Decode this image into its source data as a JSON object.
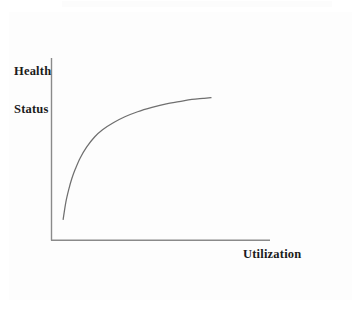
{
  "figure": {
    "background_color": "#fdfdfd",
    "frame_color": "#3a3a3a",
    "axis_color": "#8a8a8a",
    "curve_color": "#6f6f6f",
    "text_color": "#1b1b1b"
  },
  "labels": {
    "y_axis_line1": "Health",
    "y_axis_line2": "Status",
    "x_axis": "Utilization"
  },
  "chart_data": {
    "type": "line",
    "title": "",
    "subtitle": "",
    "xlabel": "Utilization",
    "ylabel": "Health Status",
    "grid": false,
    "legend": "none",
    "annotations": [],
    "xlim": [
      0,
      1
    ],
    "ylim": [
      0,
      1
    ],
    "xtick_labels": [],
    "ytick_labels": [],
    "series": [
      {
        "name": "Health status vs utilization",
        "x": [
          0.073,
          0.09,
          0.11,
          0.128,
          0.15,
          0.18,
          0.22,
          0.27,
          0.32,
          0.39,
          0.46,
          0.54,
          0.63,
          0.72,
          0.8,
          0.88,
          0.95,
          1.0
        ],
        "y": [
          0.115,
          0.235,
          0.33,
          0.4,
          0.465,
          0.54,
          0.615,
          0.685,
          0.735,
          0.785,
          0.825,
          0.86,
          0.89,
          0.915,
          0.93,
          0.945,
          0.952,
          0.957
        ]
      }
    ]
  }
}
